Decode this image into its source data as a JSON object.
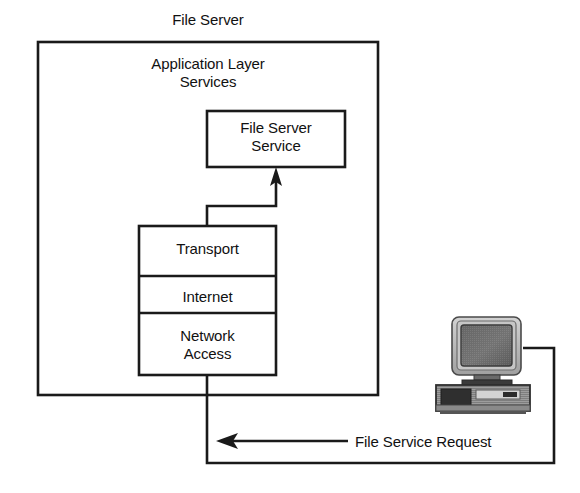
{
  "diagram": {
    "type": "network-architecture-diagram",
    "title": "File Server",
    "outer_container_label": "File Server",
    "app_layer_label": "Application Layer\nServices",
    "nodes": {
      "file_server_service": "File Server\nService",
      "transport": "Transport",
      "internet": "Internet",
      "network_access": "Network\nAccess"
    },
    "flow_label": "File Service Request",
    "client_icon": "desktop-computer-icon",
    "colors": {
      "stroke": "#1a1a1a",
      "background": "#ffffff",
      "monitor_bezel": "#b5b5b5",
      "monitor_screen": "#5a5a5a",
      "case_body": "#9a9a9a",
      "case_dark": "#333333"
    },
    "arrows": [
      {
        "name": "stack-to-service-arrow",
        "from": "Transport",
        "to": "File Server Service",
        "direction": "up"
      },
      {
        "name": "file-service-request-arrow",
        "from": "client computer",
        "to": "File Server",
        "direction": "left",
        "label": "File Service Request"
      }
    ]
  }
}
